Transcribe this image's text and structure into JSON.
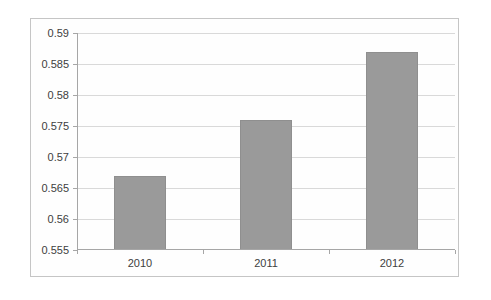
{
  "chart_data": {
    "type": "bar",
    "title": "",
    "categories": [
      "2010",
      "2011",
      "2012"
    ],
    "values": [
      0.567,
      0.576,
      0.587
    ],
    "xlabel": "",
    "ylabel": "",
    "ylim": [
      0.555,
      0.59
    ],
    "ytick_step": 0.005,
    "ytick_labels": [
      "0.555",
      "0.56",
      "0.565",
      "0.57",
      "0.575",
      "0.58",
      "0.585",
      "0.59"
    ],
    "grid": true,
    "legend": "none",
    "colors": {
      "bar_fill": "#9a9a9a",
      "bar_edge": "#8f8f8f",
      "gridline": "#d9d9d9",
      "axis": "#a6a6a6",
      "tick": "#a6a6a6",
      "text": "#404040",
      "frame_border": "#c5c5c5",
      "background": "#fefefe"
    }
  }
}
